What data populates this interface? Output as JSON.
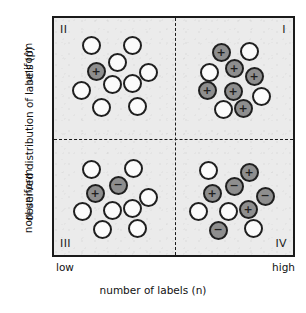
{
  "chart_data": {
    "type": "scatter",
    "title": "",
    "xlabel": "number of labels (n)",
    "ylabel": "observed distribution of labels (p̂)",
    "x_ticks": [
      "low",
      "high"
    ],
    "y_ticks": [
      "uniform",
      "non-uniform"
    ],
    "grid": false,
    "legend": "none",
    "annotations": [
      "II",
      "I",
      "III",
      "IV"
    ],
    "quadrants": [
      {
        "id": "II",
        "label": "II",
        "corner": "top-left",
        "x_level": "low",
        "y_level": "uniform",
        "counts": {
          "white": 9,
          "gray_plus": 1,
          "gray_minus": 0,
          "total": 10
        },
        "points": [
          {
            "x": 91,
            "y": 45,
            "fill": "white",
            "symbol": ""
          },
          {
            "x": 132,
            "y": 45,
            "fill": "white",
            "symbol": ""
          },
          {
            "x": 117,
            "y": 62,
            "fill": "white",
            "symbol": ""
          },
          {
            "x": 96,
            "y": 71,
            "fill": "gray",
            "symbol": "+"
          },
          {
            "x": 148,
            "y": 72,
            "fill": "white",
            "symbol": ""
          },
          {
            "x": 112,
            "y": 84,
            "fill": "white",
            "symbol": ""
          },
          {
            "x": 132,
            "y": 83,
            "fill": "white",
            "symbol": ""
          },
          {
            "x": 81,
            "y": 90,
            "fill": "white",
            "symbol": ""
          },
          {
            "x": 101,
            "y": 107,
            "fill": "white",
            "symbol": ""
          },
          {
            "x": 137,
            "y": 106,
            "fill": "white",
            "symbol": ""
          }
        ]
      },
      {
        "id": "I",
        "label": "I",
        "corner": "top-right",
        "x_level": "high",
        "y_level": "uniform",
        "counts": {
          "white": 4,
          "gray_plus": 6,
          "gray_minus": 0,
          "total": 10
        },
        "points": [
          {
            "x": 221,
            "y": 52,
            "fill": "gray",
            "symbol": "+"
          },
          {
            "x": 249,
            "y": 51,
            "fill": "white",
            "symbol": ""
          },
          {
            "x": 234,
            "y": 68,
            "fill": "gray",
            "symbol": "+"
          },
          {
            "x": 209,
            "y": 72,
            "fill": "white",
            "symbol": ""
          },
          {
            "x": 254,
            "y": 76,
            "fill": "gray",
            "symbol": "+"
          },
          {
            "x": 207,
            "y": 90,
            "fill": "gray",
            "symbol": "+"
          },
          {
            "x": 233,
            "y": 91,
            "fill": "gray",
            "symbol": "+"
          },
          {
            "x": 261,
            "y": 96,
            "fill": "white",
            "symbol": ""
          },
          {
            "x": 223,
            "y": 109,
            "fill": "white",
            "symbol": ""
          },
          {
            "x": 243,
            "y": 108,
            "fill": "gray",
            "symbol": "+"
          }
        ]
      },
      {
        "id": "III",
        "label": "III",
        "corner": "bottom-left",
        "x_level": "low",
        "y_level": "non-uniform",
        "counts": {
          "white": 8,
          "gray_plus": 1,
          "gray_minus": 1,
          "total": 10
        },
        "points": [
          {
            "x": 91,
            "y": 169,
            "fill": "white",
            "symbol": ""
          },
          {
            "x": 133,
            "y": 168,
            "fill": "white",
            "symbol": ""
          },
          {
            "x": 118,
            "y": 185,
            "fill": "gray",
            "symbol": "−"
          },
          {
            "x": 95,
            "y": 193,
            "fill": "gray",
            "symbol": "+"
          },
          {
            "x": 148,
            "y": 197,
            "fill": "white",
            "symbol": ""
          },
          {
            "x": 82,
            "y": 211,
            "fill": "white",
            "symbol": ""
          },
          {
            "x": 112,
            "y": 210,
            "fill": "white",
            "symbol": ""
          },
          {
            "x": 132,
            "y": 208,
            "fill": "white",
            "symbol": ""
          },
          {
            "x": 102,
            "y": 229,
            "fill": "white",
            "symbol": ""
          },
          {
            "x": 137,
            "y": 228,
            "fill": "white",
            "symbol": ""
          }
        ]
      },
      {
        "id": "IV",
        "label": "IV",
        "corner": "bottom-right",
        "x_level": "high",
        "y_level": "non-uniform",
        "counts": {
          "white": 4,
          "gray_plus": 3,
          "gray_minus": 3,
          "total": 10
        },
        "points": [
          {
            "x": 208,
            "y": 170,
            "fill": "white",
            "symbol": ""
          },
          {
            "x": 249,
            "y": 172,
            "fill": "gray",
            "symbol": "+"
          },
          {
            "x": 234,
            "y": 186,
            "fill": "gray",
            "symbol": "−"
          },
          {
            "x": 212,
            "y": 193,
            "fill": "gray",
            "symbol": "+"
          },
          {
            "x": 265,
            "y": 196,
            "fill": "gray",
            "symbol": "−"
          },
          {
            "x": 198,
            "y": 211,
            "fill": "white",
            "symbol": ""
          },
          {
            "x": 228,
            "y": 211,
            "fill": "white",
            "symbol": ""
          },
          {
            "x": 248,
            "y": 209,
            "fill": "gray",
            "symbol": "+"
          },
          {
            "x": 218,
            "y": 230,
            "fill": "gray",
            "symbol": "−"
          },
          {
            "x": 253,
            "y": 228,
            "fill": "white",
            "symbol": ""
          }
        ]
      }
    ],
    "colors": {
      "plot_background": "#ebebeb",
      "frame": "#1a1a1a",
      "gray_marker": "#8e8e8e",
      "white_marker": "#fbfbfb",
      "text": "#111111"
    }
  },
  "axes": {
    "y_title": "observed distribution of labels (p̂)",
    "y_tick_top": "uniform",
    "y_tick_bottom": "non-uniform",
    "x_title": "number of labels (n)",
    "x_tick_left": "low",
    "x_tick_right": "high"
  },
  "quadrant_labels": {
    "top_left": "II",
    "top_right": "I",
    "bottom_left": "III",
    "bottom_right": "IV"
  }
}
